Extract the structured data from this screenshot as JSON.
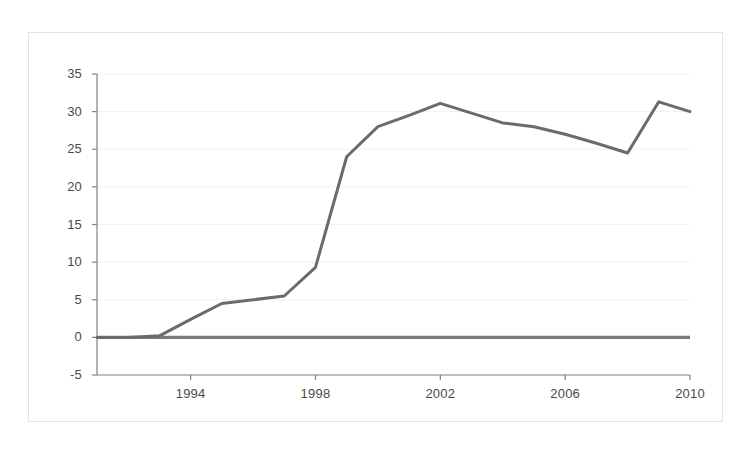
{
  "chart_data": {
    "type": "line",
    "title": "",
    "subtitle": "",
    "xlabel": "",
    "ylabel": "",
    "xlim": [
      1991,
      2010
    ],
    "ylim": [
      -5,
      35
    ],
    "grid": true,
    "legend": null,
    "zero_reference_line": 0,
    "yticks": [
      35,
      30,
      25,
      20,
      15,
      10,
      5,
      0,
      -5
    ],
    "xticks": [
      1994,
      1998,
      2002,
      2006,
      2010
    ],
    "x": [
      1991,
      1992,
      1993,
      1994,
      1995,
      1996,
      1997,
      1998,
      1999,
      2000,
      2001,
      2002,
      2003,
      2004,
      2005,
      2006,
      2007,
      2008,
      2009,
      2010
    ],
    "series": [
      {
        "name": "series-1",
        "color": "#6b6b6b",
        "values": [
          0.0,
          0.0,
          0.2,
          2.4,
          4.5,
          5.0,
          5.5,
          9.3,
          24.0,
          28.0,
          29.5,
          31.1,
          29.8,
          28.5,
          28.0,
          27.0,
          25.8,
          24.5,
          31.3,
          30.0
        ]
      }
    ],
    "styles": {
      "background": "#ffffff",
      "frame_border": "#e3e3e3",
      "axis_line": "#808080",
      "gridline": "#f1f1f1",
      "tick_text": "#4a4a4a",
      "zero_line_color": "#7a7a7a"
    }
  }
}
